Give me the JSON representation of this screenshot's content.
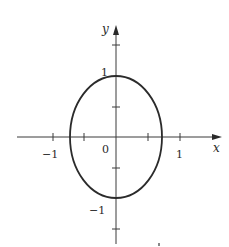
{
  "figure": {
    "colors": {
      "curve": "#2b2b2b",
      "axis": "#3a3a3a",
      "background": "#ffffff"
    }
  },
  "axes": {
    "x_label": "x",
    "y_label": "y",
    "origin_label": "0",
    "x_tick_labels": {
      "neg1": "−1",
      "pos1": "1"
    },
    "y_tick_labels": {
      "pos1": "1",
      "neg1": "−1"
    },
    "x_ticks": [
      -1,
      -0.5,
      0.5,
      1
    ],
    "y_ticks": [
      -1.5,
      -0.5,
      0.5,
      1.5
    ],
    "xlim": [
      -1.55,
      1.6
    ],
    "ylim": [
      -1.7,
      1.8
    ]
  },
  "curve": {
    "type": "ellipse",
    "center": [
      0,
      0
    ],
    "semi_axis_x": 0.72,
    "semi_axis_y": 1.0
  }
}
